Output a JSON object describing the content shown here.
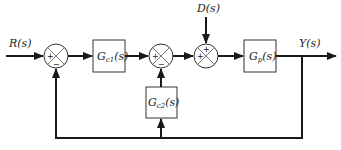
{
  "diagram": {
    "type": "block-diagram",
    "signals": {
      "input": {
        "main": "R",
        "arg": "(s)"
      },
      "disturbance": {
        "main": "D",
        "arg": "(s)"
      },
      "output": {
        "main": "Y",
        "arg": "(s)"
      }
    },
    "blocks": [
      {
        "id": "gc1",
        "main": "G",
        "sub": "c1",
        "arg": "(s)"
      },
      {
        "id": "gc2",
        "main": "G",
        "sub": "c2",
        "arg": "(s)"
      },
      {
        "id": "gp",
        "main": "G",
        "sub": "p",
        "arg": "(s)"
      }
    ],
    "summing_junctions": [
      {
        "id": "sum1",
        "signs": {
          "left": "+",
          "bottom": "−"
        }
      },
      {
        "id": "sum2",
        "signs": {
          "left": "+",
          "bottom": "−"
        }
      },
      {
        "id": "sum3",
        "signs": {
          "left": "+",
          "top": "+"
        }
      }
    ],
    "connections": [
      "R(s) -> sum1(+)",
      "sum1 -> Gc1(s)",
      "Gc1(s) -> sum2(+)",
      "sum2 -> sum3(+)",
      "D(s) -> sum3(+)",
      "sum3 -> Gp(s)",
      "Gp(s) -> Y(s)",
      "Y(s) -> Gc2(s)",
      "Gc2(s) -> sum2(−)",
      "Y(s) -> sum1(−)"
    ]
  }
}
